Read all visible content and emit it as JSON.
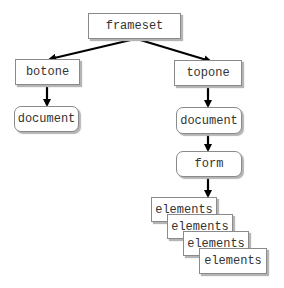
{
  "diagram": {
    "root": {
      "label": "frameset"
    },
    "left_branch": {
      "frame": "botone",
      "document": "document"
    },
    "right_branch": {
      "frame": "topone",
      "document": "document",
      "form": "form",
      "elements": [
        "elements",
        "elements",
        "elements",
        "elements"
      ]
    }
  },
  "colors": {
    "border": "#8a8a8a",
    "arrow": "#000000",
    "text": "#333333"
  }
}
